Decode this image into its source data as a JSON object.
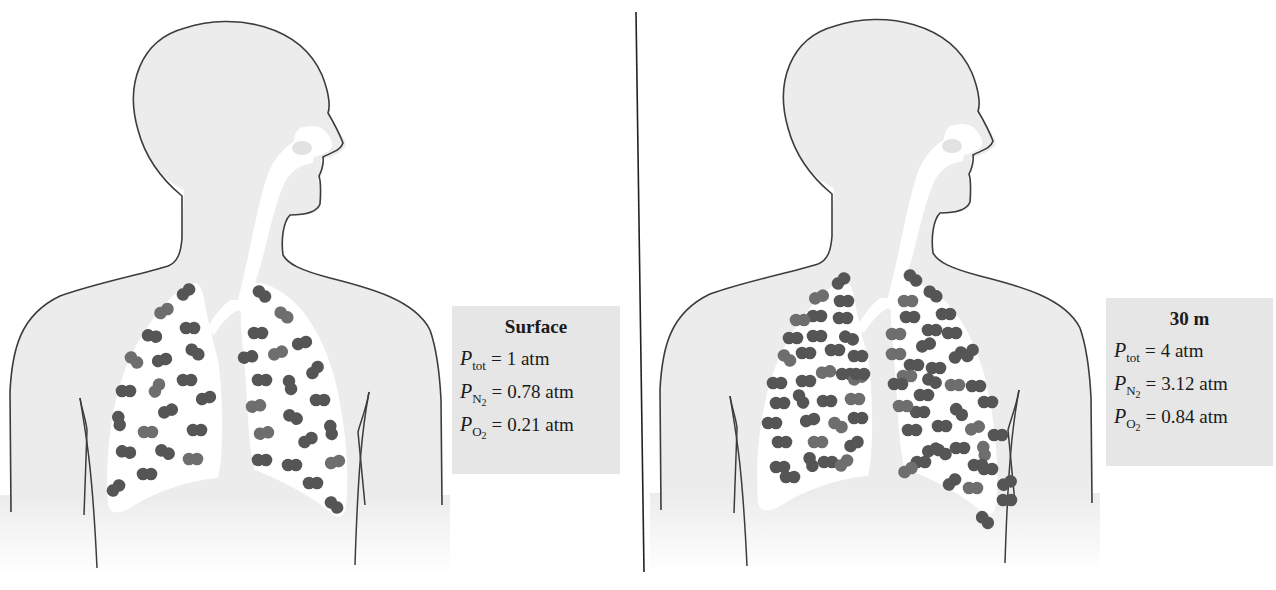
{
  "figure": {
    "panels": [
      {
        "id": "surface",
        "label": {
          "title": "Surface",
          "rows": [
            {
              "symbol": "P",
              "subscript": "tot",
              "subscript_sub": "",
              "equals": "=",
              "value": "1 atm"
            },
            {
              "symbol": "P",
              "subscript": "N",
              "subscript_sub": "2",
              "equals": "=",
              "value": "0.78 atm"
            },
            {
              "symbol": "P",
              "subscript": "O",
              "subscript_sub": "2",
              "equals": "=",
              "value": "0.21 atm"
            }
          ]
        },
        "molecule_count": 45
      },
      {
        "id": "depth-30m",
        "label": {
          "title": "30 m",
          "rows": [
            {
              "symbol": "P",
              "subscript": "tot",
              "subscript_sub": "",
              "equals": "=",
              "value": "4 atm"
            },
            {
              "symbol": "P",
              "subscript": "N",
              "subscript_sub": "2",
              "equals": "=",
              "value": "3.12 atm"
            },
            {
              "symbol": "P",
              "subscript": "O",
              "subscript_sub": "2",
              "equals": "=",
              "value": "0.84 atm"
            }
          ]
        },
        "molecule_count": 120
      }
    ],
    "colors": {
      "body_fill": "#ececec",
      "outline": "#3c3c3c",
      "airway": "#ffffff",
      "molecule_dark": "#555555",
      "molecule_light": "#6e6e6e",
      "label_bg": "#e6e6e6",
      "divider": "#222222"
    },
    "molecules": {
      "surface": [
        [
          186,
          292,
          -40
        ],
        [
          164,
          311,
          -30
        ],
        [
          190,
          328,
          0
        ],
        [
          152,
          336,
          10
        ],
        [
          195,
          352,
          35
        ],
        [
          134,
          360,
          40
        ],
        [
          162,
          360,
          -15
        ],
        [
          187,
          380,
          0
        ],
        [
          126,
          391,
          0
        ],
        [
          157,
          388,
          -60
        ],
        [
          206,
          398,
          -15
        ],
        [
          168,
          411,
          -20
        ],
        [
          119,
          421,
          80
        ],
        [
          148,
          432,
          0
        ],
        [
          197,
          430,
          0
        ],
        [
          126,
          452,
          10
        ],
        [
          165,
          452,
          25
        ],
        [
          193,
          459,
          0
        ],
        [
          147,
          474,
          0
        ],
        [
          116,
          488,
          -40
        ],
        [
          262,
          294,
          40
        ],
        [
          284,
          315,
          35
        ],
        [
          258,
          333,
          0
        ],
        [
          302,
          343,
          -15
        ],
        [
          248,
          357,
          -10
        ],
        [
          278,
          353,
          -20
        ],
        [
          315,
          370,
          -50
        ],
        [
          262,
          380,
          0
        ],
        [
          290,
          385,
          75
        ],
        [
          256,
          406,
          -10
        ],
        [
          320,
          400,
          0
        ],
        [
          293,
          417,
          25
        ],
        [
          331,
          430,
          80
        ],
        [
          264,
          433,
          -10
        ],
        [
          308,
          440,
          -30
        ],
        [
          262,
          460,
          0
        ],
        [
          292,
          465,
          0
        ],
        [
          335,
          462,
          -15
        ],
        [
          313,
          483,
          0
        ],
        [
          334,
          505,
          40
        ]
      ],
      "depth-30m": [
        [
          841,
          281,
          -40
        ],
        [
          819,
          297,
          -20
        ],
        [
          844,
          301,
          0
        ],
        [
          817,
          316,
          0
        ],
        [
          843,
          318,
          0
        ],
        [
          800,
          320,
          0
        ],
        [
          793,
          338,
          0
        ],
        [
          817,
          336,
          0
        ],
        [
          849,
          338,
          20
        ],
        [
          787,
          358,
          40
        ],
        [
          806,
          353,
          0
        ],
        [
          835,
          350,
          0
        ],
        [
          858,
          356,
          0
        ],
        [
          826,
          372,
          -10
        ],
        [
          846,
          374,
          0
        ],
        [
          777,
          383,
          0
        ],
        [
          806,
          381,
          0
        ],
        [
          858,
          378,
          -20
        ],
        [
          780,
          403,
          0
        ],
        [
          801,
          399,
          60
        ],
        [
          827,
          401,
          0
        ],
        [
          855,
          399,
          0
        ],
        [
          860,
          374,
          0
        ],
        [
          772,
          423,
          0
        ],
        [
          810,
          420,
          -15
        ],
        [
          838,
          425,
          30
        ],
        [
          858,
          418,
          0
        ],
        [
          854,
          444,
          -30
        ],
        [
          782,
          442,
          0
        ],
        [
          818,
          442,
          0
        ],
        [
          780,
          467,
          0
        ],
        [
          811,
          462,
          70
        ],
        [
          828,
          462,
          0
        ],
        [
          844,
          463,
          -40
        ],
        [
          790,
          477,
          0
        ],
        [
          913,
          278,
          40
        ],
        [
          933,
          294,
          35
        ],
        [
          908,
          301,
          0
        ],
        [
          946,
          314,
          0
        ],
        [
          910,
          317,
          0
        ],
        [
          932,
          330,
          0
        ],
        [
          896,
          334,
          0
        ],
        [
          926,
          345,
          -20
        ],
        [
          952,
          333,
          0
        ],
        [
          958,
          355,
          -40
        ],
        [
          896,
          354,
          0
        ],
        [
          914,
          365,
          0
        ],
        [
          936,
          368,
          0
        ],
        [
          970,
          353,
          -50
        ],
        [
          907,
          376,
          0
        ],
        [
          932,
          381,
          25
        ],
        [
          898,
          384,
          0
        ],
        [
          924,
          395,
          0
        ],
        [
          955,
          385,
          0
        ],
        [
          976,
          386,
          0
        ],
        [
          920,
          412,
          0
        ],
        [
          959,
          412,
          45
        ],
        [
          903,
          406,
          0
        ],
        [
          988,
          402,
          0
        ],
        [
          912,
          430,
          0
        ],
        [
          942,
          426,
          0
        ],
        [
          975,
          428,
          -20
        ],
        [
          998,
          435,
          0
        ],
        [
          932,
          450,
          -20
        ],
        [
          960,
          448,
          0
        ],
        [
          984,
          451,
          80
        ],
        [
          921,
          462,
          0
        ],
        [
          942,
          452,
          30
        ],
        [
          978,
          465,
          0
        ],
        [
          908,
          470,
          -30
        ],
        [
          952,
          482,
          -40
        ],
        [
          988,
          469,
          0
        ],
        [
          1007,
          483,
          -25
        ],
        [
          973,
          488,
          0
        ],
        [
          1007,
          500,
          0
        ],
        [
          985,
          520,
          45
        ]
      ]
    },
    "extra_molecules": {
      "depth-30m": [
        [
          870,
          315,
          0
        ],
        [
          880,
          345,
          0
        ],
        [
          868,
          396,
          0
        ],
        [
          885,
          430,
          0
        ],
        [
          874,
          452,
          0
        ],
        [
          873,
          470,
          0
        ],
        [
          995,
          422,
          0
        ],
        [
          1000,
          455,
          0
        ],
        [
          948,
          470,
          0
        ],
        [
          916,
          445,
          0
        ],
        [
          890,
          455,
          0
        ],
        [
          803,
          437,
          0
        ],
        [
          776,
          430,
          0
        ],
        [
          797,
          423,
          0
        ],
        [
          822,
          312,
          0
        ],
        [
          866,
          330,
          0
        ],
        [
          888,
          318,
          0
        ],
        [
          902,
          290,
          0
        ],
        [
          976,
          330,
          0
        ],
        [
          990,
          375,
          0
        ],
        [
          965,
          505,
          0
        ],
        [
          928,
          505,
          0
        ],
        [
          818,
          453,
          0
        ],
        [
          846,
          485,
          0
        ],
        [
          865,
          485,
          0
        ],
        [
          895,
          500,
          0
        ],
        [
          1010,
          520,
          0
        ],
        [
          1012,
          460,
          0
        ],
        [
          955,
          310,
          0
        ],
        [
          939,
          355,
          0
        ],
        [
          920,
          350,
          0
        ],
        [
          975,
          375,
          0
        ],
        [
          776,
          455,
          0
        ],
        [
          781,
          495,
          0
        ],
        [
          856,
          290,
          0
        ],
        [
          833,
          390,
          0
        ],
        [
          850,
          405,
          0
        ],
        [
          813,
          484,
          0
        ],
        [
          794,
          470,
          0
        ],
        [
          940,
          400,
          0
        ],
        [
          960,
          470,
          0
        ],
        [
          985,
          490,
          0
        ],
        [
          1000,
          500,
          0
        ],
        [
          830,
          445,
          0
        ],
        [
          905,
          390,
          0
        ]
      ]
    }
  }
}
